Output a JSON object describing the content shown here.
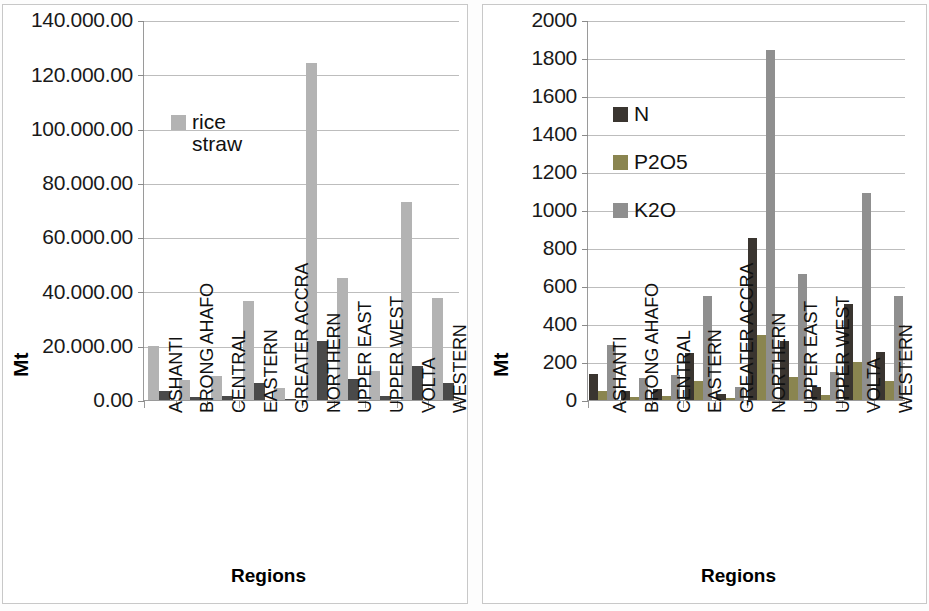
{
  "figure": {
    "background": "#ffffff",
    "panel_border": "#c8c8c8"
  },
  "chart_data": [
    {
      "id": "left",
      "type": "bar",
      "title": "",
      "xlabel": "Regions",
      "ylabel": "Mt",
      "ylim": [
        0,
        140000
      ],
      "ytick_labels": [
        "140.000.00",
        "120.000.00",
        "100.000.00",
        "80.000.00",
        "60.000.00",
        "40.000.00",
        "20.000.00",
        "0.00"
      ],
      "ytick_values": [
        140000,
        120000,
        100000,
        80000,
        60000,
        40000,
        20000,
        0
      ],
      "grid": true,
      "legend_position": "inside-upper-left",
      "categories": [
        "ASHANTI",
        "BRONG AHAFO",
        "CENTRAL",
        "EASTERN",
        "GREATER ACCRA",
        "NORTHERN",
        "UPPER EAST",
        "UPPER WEST",
        "VOLTA",
        "WESTERN"
      ],
      "series": [
        {
          "name": "rice\nstraw",
          "legend_label": "rice\nstraw",
          "color": "#b3b3b3",
          "values": [
            19800,
            7200,
            8800,
            36500,
            4600,
            124000,
            45000,
            10700,
            73000,
            37500
          ]
        },
        {
          "name": "series2",
          "legend_label": "",
          "color": "#4a4a4a",
          "values": [
            3500,
            1000,
            1300,
            6400,
            400,
            21600,
            7800,
            1500,
            12500,
            6300
          ]
        }
      ]
    },
    {
      "id": "right",
      "type": "bar",
      "title": "",
      "xlabel": "Regions",
      "ylabel": "Mt",
      "ylim": [
        0,
        2000
      ],
      "ytick_labels": [
        "2000",
        "1800",
        "1600",
        "1400",
        "1200",
        "1000",
        "800",
        "600",
        "400",
        "200",
        "0"
      ],
      "ytick_values": [
        2000,
        1800,
        1600,
        1400,
        1200,
        1000,
        800,
        600,
        400,
        200,
        0
      ],
      "grid": true,
      "legend_position": "inside-upper-left",
      "categories": [
        "ASHANTI",
        "BRONG AHAFO",
        "CENTRAL",
        "EASTERN",
        "GREATER ACCRA",
        "NORTHERN",
        "UPPER EAST",
        "UPPER WEST",
        "VOLTA",
        "WESTERN"
      ],
      "series": [
        {
          "name": "N",
          "legend_label": "N",
          "color": "#3a3530",
          "values": [
            135,
            50,
            60,
            250,
            30,
            855,
            310,
            70,
            505,
            255
          ]
        },
        {
          "name": "P2O5",
          "legend_label": "P2O5",
          "color": "#8a8550",
          "values": [
            50,
            18,
            22,
            100,
            12,
            340,
            120,
            25,
            200,
            100
          ]
        },
        {
          "name": "K2O",
          "legend_label": "K2O",
          "color": "#8f8f8f",
          "values": [
            290,
            115,
            130,
            545,
            70,
            1840,
            665,
            150,
            1090,
            550
          ]
        }
      ]
    }
  ]
}
